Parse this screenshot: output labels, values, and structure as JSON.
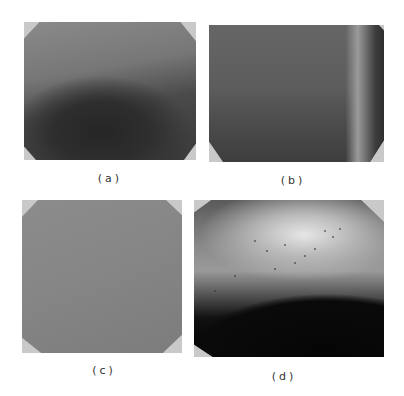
{
  "figure": {
    "panels": [
      {
        "id": "a",
        "label": "(a)",
        "description": "wafer photo, dark shading in lower center"
      },
      {
        "id": "b",
        "label": "(b)",
        "description": "wafer photo, uniform dark gray with lighter right edge"
      },
      {
        "id": "c",
        "label": "(c)",
        "description": "wafer photo, uniform medium gray"
      },
      {
        "id": "d",
        "label": "(d)",
        "description": "wafer photo, bright speckled upper band with dark lower region"
      }
    ]
  }
}
